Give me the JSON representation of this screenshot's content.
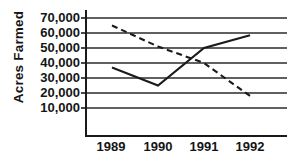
{
  "chart_data": {
    "type": "line",
    "title": "",
    "subtitle": "",
    "xlabel": "",
    "ylabel": "Acres Farmed",
    "categories": [
      "1989",
      "1990",
      "1991",
      "1992"
    ],
    "x_tick_labels": [
      "1989",
      "1990",
      "1991",
      "1992"
    ],
    "y_tick_labels": [
      "70,000",
      "60,000",
      "50,000",
      "40,000",
      "30,000",
      "20,000",
      "10,000"
    ],
    "y_tick_values": [
      70000,
      60000,
      50000,
      40000,
      30000,
      20000,
      10000
    ],
    "ylim": [
      0,
      70000
    ],
    "ytick_step": 10000,
    "grid": "horizontal",
    "legend": "none",
    "series": [
      {
        "name": "solid-series",
        "style": "solid",
        "color": "#1a1a1a",
        "values": [
          37000,
          25000,
          50000,
          58500
        ]
      },
      {
        "name": "dashed-series",
        "style": "dashed",
        "color": "#1a1a1a",
        "values": [
          65000,
          51000,
          40000,
          18000
        ]
      }
    ],
    "annotations": []
  },
  "axes": {
    "y_title": "Acres Farmed",
    "axis_color": "#1a1a1a",
    "gridline_color": "#2b2b2b"
  }
}
